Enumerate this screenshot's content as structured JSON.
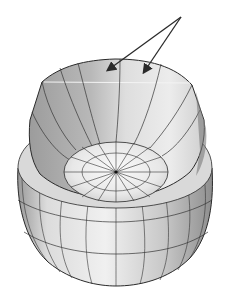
{
  "figure": {
    "type": "3d-mesh-illustration",
    "annotation_arrows": [
      {
        "from": [
          181,
          17
        ],
        "to": [
          107,
          71
        ]
      },
      {
        "from": [
          181,
          17
        ],
        "to": [
          143,
          73
        ]
      }
    ],
    "colors": {
      "background": "#ffffff",
      "edge": "#2a2a2a",
      "shade_dark": "#8c8c8c",
      "shade_mid": "#b4b4b4",
      "shade_light": "#d6d6d6",
      "shade_highlight": "#f2f2f2"
    }
  }
}
